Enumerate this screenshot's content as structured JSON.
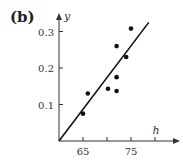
{
  "panel_label": "(b)",
  "chart_data": {
    "type": "scatter",
    "title": "",
    "xlabel": "h",
    "ylabel": "y",
    "x_ticks": [
      65,
      75
    ],
    "y_ticks": [
      "0.1",
      "0.2",
      "0.3"
    ],
    "xlim": [
      60,
      80
    ],
    "ylim": [
      0,
      0.33
    ],
    "grid": false,
    "legend": null,
    "points": [
      {
        "x": 65,
        "y": 0.075
      },
      {
        "x": 66,
        "y": 0.13
      },
      {
        "x": 70.2,
        "y": 0.143
      },
      {
        "x": 72,
        "y": 0.26
      },
      {
        "x": 72,
        "y": 0.175
      },
      {
        "x": 72,
        "y": 0.137
      },
      {
        "x": 74,
        "y": 0.23
      },
      {
        "x": 75,
        "y": 0.308
      }
    ],
    "fit_line": {
      "x1": 60,
      "y1": 0,
      "x2": 78.7,
      "y2": 0.325
    }
  }
}
